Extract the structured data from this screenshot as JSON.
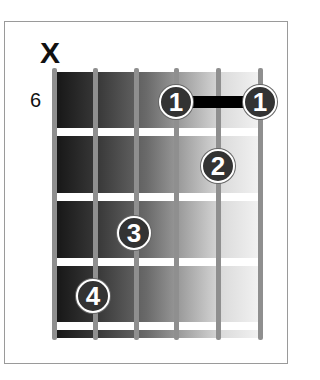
{
  "diagram": {
    "type": "guitar-chord-diagram",
    "muted_string_label": "X",
    "starting_fret_label": "6",
    "strings_count": 6,
    "frets_shown": 4,
    "barre": {
      "finger": "1",
      "fret": 1,
      "from_string": 4,
      "to_string": 6
    },
    "fingers": [
      {
        "label": "1",
        "string": 4,
        "fret": 1
      },
      {
        "label": "1",
        "string": 6,
        "fret": 1
      },
      {
        "label": "2",
        "string": 5,
        "fret": 2
      },
      {
        "label": "3",
        "string": 3,
        "fret": 3
      },
      {
        "label": "4",
        "string": 2,
        "fret": 4
      }
    ],
    "colors": {
      "dot": "#333333",
      "barre": "#000000",
      "string": "#8f8f8f",
      "frame": "#9a9a9a"
    }
  }
}
